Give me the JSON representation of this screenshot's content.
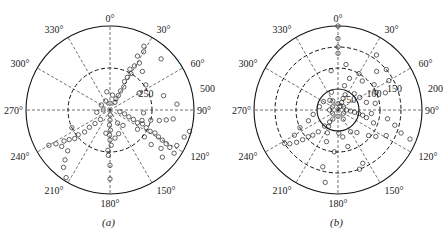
{
  "figure": {
    "panels": [
      {
        "id": "a",
        "caption": "(a)",
        "center": [
          110,
          110
        ],
        "outer_radius": 84,
        "r_max": 500,
        "angle_labels": [
          "0°",
          "30°",
          "60°",
          "90°",
          "120°",
          "150°",
          "180°",
          "210°",
          "240°",
          "270°",
          "300°",
          "330°"
        ],
        "rings": [
          {
            "value": 250,
            "label": "250",
            "style": "dashed"
          },
          {
            "value": 500,
            "label": "500",
            "style": "solid"
          }
        ]
      },
      {
        "id": "b",
        "caption": "(b)",
        "center": [
          338,
          110
        ],
        "outer_radius": 84,
        "r_max": 200,
        "angle_labels": [
          "0°",
          "30°",
          "60°",
          "90°",
          "120°",
          "150°",
          "180°",
          "210°",
          "240°",
          "270°",
          "300°",
          "330°"
        ],
        "rings": [
          {
            "value": 50,
            "label": "50",
            "style": "solid"
          },
          {
            "value": 100,
            "label": "100",
            "style": "dashed"
          },
          {
            "value": 150,
            "label": "150",
            "style": "dashed"
          },
          {
            "value": 200,
            "label": "200",
            "style": "solid"
          }
        ]
      }
    ]
  },
  "chart_data": [
    {
      "type": "scatter",
      "subtype": "polar",
      "title": "(a)",
      "angle_unit": "degrees",
      "angle_zero": "top",
      "angle_direction": "clockwise",
      "theta_ticks": [
        0,
        30,
        60,
        90,
        120,
        150,
        180,
        210,
        240,
        270,
        300,
        330
      ],
      "r_ticks": [
        250,
        500
      ],
      "rlim": [
        0,
        500
      ],
      "grid": true,
      "marker": "open-circle",
      "clusters": [
        {
          "theta_range": [
            20,
            35
          ],
          "r_range": [
            20,
            450
          ],
          "density": "high",
          "note": "arm toward ~30°"
        },
        {
          "theta_range": [
            100,
            130
          ],
          "r_range": [
            20,
            490
          ],
          "density": "very high",
          "note": "broad lobe toward ~110°-125°"
        },
        {
          "theta_range": [
            175,
            185
          ],
          "r_range": [
            10,
            250
          ],
          "density": "high",
          "note": "arm toward 180°"
        },
        {
          "theta_range": [
            225,
            240
          ],
          "r_range": [
            50,
            470
          ],
          "density": "medium",
          "note": "arm toward ~230°"
        }
      ],
      "points": [
        {
          "theta": 28,
          "r": 430
        },
        {
          "theta": 30,
          "r": 400
        },
        {
          "theta": 27,
          "r": 360
        },
        {
          "theta": 32,
          "r": 330
        },
        {
          "theta": 29,
          "r": 300
        },
        {
          "theta": 26,
          "r": 270
        },
        {
          "theta": 30,
          "r": 250
        },
        {
          "theta": 28,
          "r": 220
        },
        {
          "theta": 27,
          "r": 190
        },
        {
          "theta": 31,
          "r": 160
        },
        {
          "theta": 29,
          "r": 130
        },
        {
          "theta": 30,
          "r": 100
        },
        {
          "theta": 28,
          "r": 75
        },
        {
          "theta": 33,
          "r": 55
        },
        {
          "theta": 45,
          "r": 430
        },
        {
          "theta": 40,
          "r": 300
        },
        {
          "theta": 55,
          "r": 260
        },
        {
          "theta": 60,
          "r": 200
        },
        {
          "theta": 75,
          "r": 330
        },
        {
          "theta": 85,
          "r": 400
        },
        {
          "theta": 10,
          "r": 90
        },
        {
          "theta": 350,
          "r": 110
        },
        {
          "theta": 0,
          "r": 40
        },
        {
          "theta": 335,
          "r": 60
        },
        {
          "theta": 100,
          "r": 60
        },
        {
          "theta": 105,
          "r": 90
        },
        {
          "theta": 110,
          "r": 120
        },
        {
          "theta": 112,
          "r": 150
        },
        {
          "theta": 115,
          "r": 180
        },
        {
          "theta": 113,
          "r": 210
        },
        {
          "theta": 116,
          "r": 240
        },
        {
          "theta": 118,
          "r": 270
        },
        {
          "theta": 117,
          "r": 300
        },
        {
          "theta": 119,
          "r": 330
        },
        {
          "theta": 120,
          "r": 360
        },
        {
          "theta": 121,
          "r": 390
        },
        {
          "theta": 122,
          "r": 420
        },
        {
          "theta": 118,
          "r": 450
        },
        {
          "theta": 110,
          "r": 470
        },
        {
          "theta": 105,
          "r": 490
        },
        {
          "theta": 108,
          "r": 200
        },
        {
          "theta": 104,
          "r": 250
        },
        {
          "theta": 102,
          "r": 300
        },
        {
          "theta": 100,
          "r": 340
        },
        {
          "theta": 98,
          "r": 380
        },
        {
          "theta": 125,
          "r": 200
        },
        {
          "theta": 128,
          "r": 260
        },
        {
          "theta": 130,
          "r": 320
        },
        {
          "theta": 127,
          "r": 380
        },
        {
          "theta": 132,
          "r": 420
        },
        {
          "theta": 124,
          "r": 460
        },
        {
          "theta": 95,
          "r": 200
        },
        {
          "theta": 140,
          "r": 120
        },
        {
          "theta": 150,
          "r": 90
        },
        {
          "theta": 160,
          "r": 150
        },
        {
          "theta": 178,
          "r": 30
        },
        {
          "theta": 180,
          "r": 60
        },
        {
          "theta": 182,
          "r": 90
        },
        {
          "theta": 179,
          "r": 120
        },
        {
          "theta": 181,
          "r": 150
        },
        {
          "theta": 180,
          "r": 180
        },
        {
          "theta": 178,
          "r": 210
        },
        {
          "theta": 183,
          "r": 240
        },
        {
          "theta": 182,
          "r": 270
        },
        {
          "theta": 180,
          "r": 330
        },
        {
          "theta": 180,
          "r": 410
        },
        {
          "theta": 170,
          "r": 170
        },
        {
          "theta": 190,
          "r": 140
        },
        {
          "theta": 225,
          "r": 80
        },
        {
          "theta": 228,
          "r": 120
        },
        {
          "theta": 230,
          "r": 160
        },
        {
          "theta": 229,
          "r": 200
        },
        {
          "theta": 232,
          "r": 240
        },
        {
          "theta": 231,
          "r": 270
        },
        {
          "theta": 234,
          "r": 300
        },
        {
          "theta": 236,
          "r": 330
        },
        {
          "theta": 233,
          "r": 360
        },
        {
          "theta": 238,
          "r": 380
        },
        {
          "theta": 226,
          "r": 350
        },
        {
          "theta": 222,
          "r": 400
        },
        {
          "theta": 219,
          "r": 440
        },
        {
          "theta": 213,
          "r": 480
        },
        {
          "theta": 240,
          "r": 420
        },
        {
          "theta": 245,
          "r": 250
        },
        {
          "theta": 260,
          "r": 80
        },
        {
          "theta": 270,
          "r": 40
        },
        {
          "theta": 300,
          "r": 60
        }
      ]
    },
    {
      "type": "scatter",
      "subtype": "polar",
      "title": "(b)",
      "angle_unit": "degrees",
      "angle_zero": "top",
      "angle_direction": "clockwise",
      "theta_ticks": [
        0,
        30,
        60,
        90,
        120,
        150,
        180,
        210,
        240,
        270,
        300,
        330
      ],
      "r_ticks": [
        50,
        100,
        150,
        200
      ],
      "rlim": [
        0,
        200
      ],
      "grid": true,
      "marker": "open-circle",
      "clusters": [
        {
          "theta_range": [
            0,
            360
          ],
          "r_range": [
            0,
            30
          ],
          "density": "very high",
          "note": "dense core inside 50 ring"
        },
        {
          "theta_range": [
            90,
            110
          ],
          "r_range": [
            10,
            70
          ],
          "density": "high",
          "note": "arm toward ~100°"
        },
        {
          "theta_range": [
            20,
            30
          ],
          "r_range": [
            10,
            45
          ],
          "density": "high",
          "note": "short arm toward ~25°"
        },
        {
          "theta_range": [
            215,
            235
          ],
          "r_range": [
            20,
            130
          ],
          "density": "medium",
          "note": "arm toward ~225°"
        },
        {
          "theta_range": [
            0,
            360
          ],
          "r_range": [
            50,
            180
          ],
          "density": "sparse",
          "note": "scattered outliers"
        }
      ],
      "points": [
        {
          "theta": 0,
          "r": 200
        },
        {
          "theta": 0,
          "r": 170
        },
        {
          "theta": 0,
          "r": 150
        },
        {
          "theta": 0,
          "r": 135
        },
        {
          "theta": 35,
          "r": 160
        },
        {
          "theta": 45,
          "r": 130
        },
        {
          "theta": 50,
          "r": 150
        },
        {
          "theta": 55,
          "r": 105
        },
        {
          "theta": 60,
          "r": 140
        },
        {
          "theta": 65,
          "r": 100
        },
        {
          "theta": 70,
          "r": 120
        },
        {
          "theta": 40,
          "r": 90
        },
        {
          "theta": 30,
          "r": 100
        },
        {
          "theta": 20,
          "r": 80
        },
        {
          "theta": 10,
          "r": 110
        },
        {
          "theta": 350,
          "r": 95
        },
        {
          "theta": 15,
          "r": 60
        },
        {
          "theta": 25,
          "r": 40
        },
        {
          "theta": 24,
          "r": 30
        },
        {
          "theta": 26,
          "r": 20
        },
        {
          "theta": 45,
          "r": 55
        },
        {
          "theta": 60,
          "r": 60
        },
        {
          "theta": 75,
          "r": 70
        },
        {
          "theta": 80,
          "r": 90
        },
        {
          "theta": 90,
          "r": 20
        },
        {
          "theta": 95,
          "r": 30
        },
        {
          "theta": 98,
          "r": 40
        },
        {
          "theta": 100,
          "r": 50
        },
        {
          "theta": 102,
          "r": 60
        },
        {
          "theta": 105,
          "r": 70
        },
        {
          "theta": 96,
          "r": 80
        },
        {
          "theta": 110,
          "r": 90
        },
        {
          "theta": 100,
          "r": 120
        },
        {
          "theta": 105,
          "r": 140
        },
        {
          "theta": 110,
          "r": 160
        },
        {
          "theta": 112,
          "r": 185
        },
        {
          "theta": 118,
          "r": 130
        },
        {
          "theta": 125,
          "r": 110
        },
        {
          "theta": 130,
          "r": 95
        },
        {
          "theta": 140,
          "r": 70
        },
        {
          "theta": 150,
          "r": 60
        },
        {
          "theta": 155,
          "r": 140
        },
        {
          "theta": 160,
          "r": 150
        },
        {
          "theta": 165,
          "r": 90
        },
        {
          "theta": 170,
          "r": 65
        },
        {
          "theta": 178,
          "r": 55
        },
        {
          "theta": 185,
          "r": 100
        },
        {
          "theta": 190,
          "r": 175
        },
        {
          "theta": 195,
          "r": 140
        },
        {
          "theta": 200,
          "r": 80
        },
        {
          "theta": 205,
          "r": 60
        },
        {
          "theta": 210,
          "r": 45
        },
        {
          "theta": 215,
          "r": 35
        },
        {
          "theta": 220,
          "r": 50
        },
        {
          "theta": 222,
          "r": 70
        },
        {
          "theta": 225,
          "r": 85
        },
        {
          "theta": 228,
          "r": 95
        },
        {
          "theta": 230,
          "r": 110
        },
        {
          "theta": 232,
          "r": 125
        },
        {
          "theta": 235,
          "r": 140
        },
        {
          "theta": 238,
          "r": 150
        },
        {
          "theta": 240,
          "r": 120
        },
        {
          "theta": 245,
          "r": 100
        },
        {
          "theta": 250,
          "r": 75
        },
        {
          "theta": 260,
          "r": 60
        },
        {
          "theta": 280,
          "r": 45
        },
        {
          "theta": 300,
          "r": 40
        },
        {
          "theta": 320,
          "r": 30
        },
        {
          "theta": 340,
          "r": 45
        },
        {
          "theta": 330,
          "r": 25
        },
        {
          "theta": 0,
          "r": 15
        },
        {
          "theta": 60,
          "r": 15
        },
        {
          "theta": 120,
          "r": 15
        },
        {
          "theta": 180,
          "r": 15
        },
        {
          "theta": 240,
          "r": 15
        },
        {
          "theta": 300,
          "r": 15
        },
        {
          "theta": 30,
          "r": 10
        },
        {
          "theta": 150,
          "r": 25
        },
        {
          "theta": 210,
          "r": 25
        },
        {
          "theta": 270,
          "r": 20
        }
      ]
    }
  ]
}
